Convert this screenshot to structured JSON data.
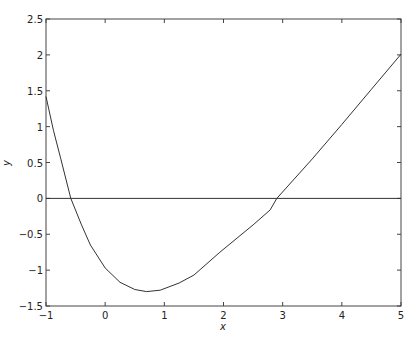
{
  "chart_data": {
    "type": "line",
    "title": "",
    "xlabel": "x",
    "ylabel": "y",
    "xlim": [
      -1,
      5
    ],
    "ylim": [
      -1.5,
      2.5
    ],
    "grid": false,
    "legend": null,
    "x_ticks": [
      "-1",
      "0",
      "1",
      "2",
      "3",
      "4",
      "5"
    ],
    "y_ticks": [
      "2.5",
      "2",
      "1.5",
      "1",
      "0.5",
      "0",
      "-0.5",
      "-1",
      "-1.5"
    ],
    "series": [
      {
        "name": "f(x)",
        "color": "#333333",
        "x": [
          -1,
          -0.875,
          -0.75,
          -0.58,
          -0.4,
          -0.25,
          0,
          0.25,
          0.5,
          0.7,
          0.93,
          1.25,
          1.5,
          1.94,
          2.5,
          2.79,
          2.9,
          3.5,
          4,
          4.5,
          5
        ],
        "y": [
          1.42,
          0.95,
          0.55,
          0,
          -0.37,
          -0.65,
          -0.97,
          -1.17,
          -1.27,
          -1.3,
          -1.28,
          -1.18,
          -1.07,
          -0.75,
          -0.37,
          -0.16,
          0,
          0.55,
          1.03,
          1.52,
          2.01
        ]
      },
      {
        "name": "y = 0",
        "color": "#333333",
        "x": [
          -1,
          5
        ],
        "y": [
          0,
          0
        ]
      }
    ],
    "annotations": [
      {
        "text": "minimum",
        "x": 0.7,
        "y": -1.3
      },
      {
        "text": "root",
        "x": -0.58,
        "y": 0
      },
      {
        "text": "root",
        "x": 2.9,
        "y": 0
      }
    ]
  }
}
